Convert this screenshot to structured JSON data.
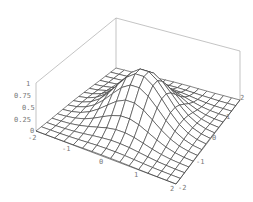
{
  "chart_data": {
    "type": "surface3d",
    "title": "",
    "function": "exp(-(x^2 + y^2))",
    "x_range": [
      -2,
      2
    ],
    "y_range": [
      -2,
      2
    ],
    "z_range": [
      0,
      1
    ],
    "mesh_divisions": 15,
    "xlabel": "",
    "ylabel": "",
    "zlabel": "",
    "x_ticks": [
      "-2",
      "-1",
      "0",
      "1",
      "2"
    ],
    "y_ticks": [
      "-2",
      "-1",
      "0",
      "1",
      "2"
    ],
    "z_ticks": [
      "0",
      "0.25",
      "0.5",
      "0.75",
      "1"
    ],
    "peak": {
      "x": 0,
      "y": 0,
      "z": 1
    },
    "box": true,
    "grid": false,
    "colors": {
      "mesh": "#333333",
      "box": "#aaaaaa",
      "surface": "#ffffff",
      "ticks": "#777777"
    }
  }
}
